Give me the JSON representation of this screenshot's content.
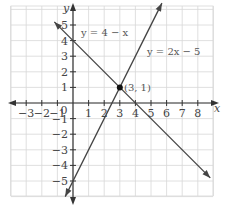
{
  "chart_data": {
    "type": "line",
    "title": "",
    "xlabel": "x",
    "ylabel": "y",
    "xlim": [
      -4.1,
      9.0
    ],
    "ylim": [
      -6.0,
      6.2
    ],
    "grid": true,
    "x_ticks": [
      "-3",
      "-2",
      "-1",
      "0",
      "1",
      "2",
      "3",
      "4",
      "5",
      "6",
      "7",
      "8"
    ],
    "y_ticks": [
      "-5",
      "-4",
      "-3",
      "-2",
      "-1",
      "1",
      "2",
      "3",
      "4",
      "5"
    ],
    "series": [
      {
        "name": "y = 4 − x",
        "slope": -1,
        "intercept": 4,
        "x_range": [
          -1.2,
          8.8
        ]
      },
      {
        "name": "y = 2x − 5",
        "slope": 2,
        "intercept": -5,
        "x_range": [
          -0.5,
          5.7
        ]
      }
    ],
    "annotations": [
      {
        "text": "(3, 1)",
        "point": [
          3,
          1
        ]
      }
    ],
    "labels": {
      "line1": "y = 4 − x",
      "line2": "y = 2x − 5",
      "intersection": "(3, 1)",
      "x_axis": "x",
      "y_axis": "y"
    },
    "colors": {
      "grid": "#d8d8d8",
      "axis": "#333333",
      "line": "#444444"
    }
  }
}
